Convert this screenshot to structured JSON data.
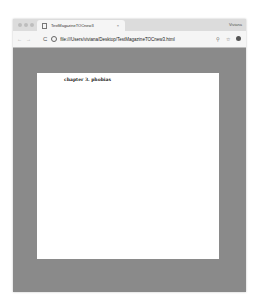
{
  "browser": {
    "tab": {
      "title": "TestMagazineTOCnew3",
      "close_icon": "×"
    },
    "profile_name": "Viviana",
    "toolbar": {
      "back_icon": "←",
      "forward_icon": "→",
      "reload_icon": "C",
      "url": "file:///Users/viviana/Desktop/TestMagazineTOCnew3.html",
      "zoom_icon": "⚲",
      "star_icon": "☆"
    }
  },
  "page": {
    "heading": "chapter 3. phobias"
  },
  "colors": {
    "viewport_bg": "#8a8a8a",
    "page_bg": "#ffffff",
    "chrome_bg": "#dcdcdc"
  }
}
